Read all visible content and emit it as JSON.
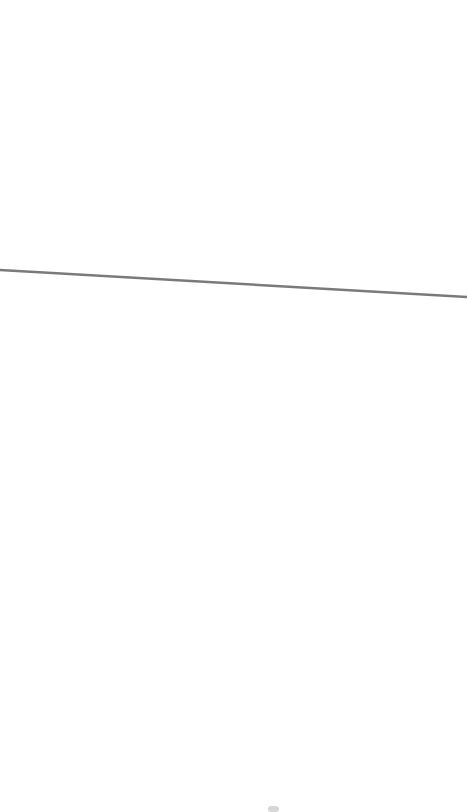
{
  "canvas": {
    "width": 467,
    "height": 812,
    "background": "#ffffff"
  },
  "stroke_line": {
    "x1": 0,
    "y1": 270,
    "x2": 467,
    "y2": 297,
    "color": "#7a7a7a",
    "width": 2.5
  },
  "bottom_smudge": {
    "x": 268,
    "y": 806,
    "width": 11,
    "height": 6,
    "color": "#d6d6d6"
  }
}
